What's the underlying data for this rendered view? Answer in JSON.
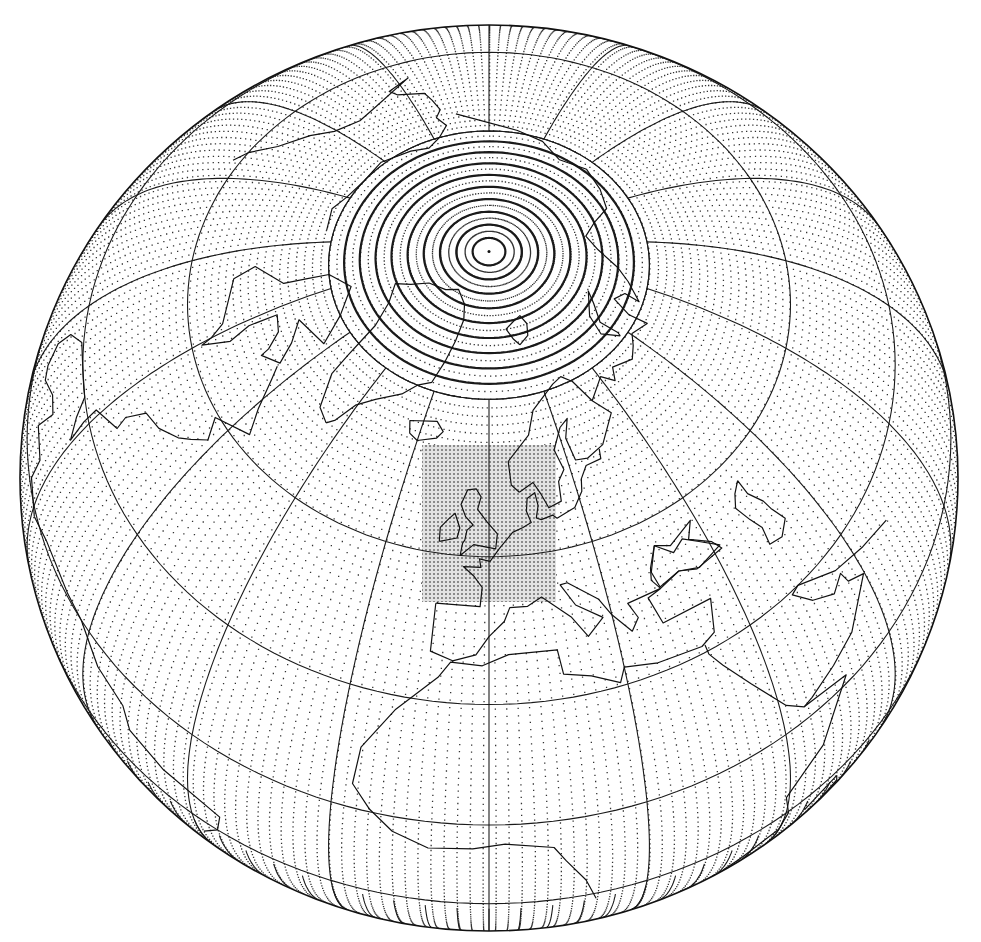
{
  "figure": {
    "caption_fragment": "",
    "projection": {
      "type": "orthographic",
      "center_lat": 60,
      "center_lon": 0,
      "center_x": 489,
      "center_y": 478,
      "radius_x": 469,
      "radius_y": 453
    },
    "graticule": {
      "parallels": [
        -10,
        10,
        30,
        50,
        70
      ],
      "meridian_step": 20,
      "polar_cap_lat": 70,
      "polar_rings": [
        72,
        74,
        76,
        78,
        80,
        82,
        84,
        86,
        88
      ],
      "line_color": "#1a1a1a"
    },
    "grid_points": {
      "lat_step_deg": 1.1,
      "lon_step_deg": 1.6,
      "dot_color": "#333333"
    },
    "high_res_domain": {
      "label": "high-resolution inner domain",
      "x": 422,
      "y": 445,
      "width": 134,
      "height": 157,
      "fill": "#d4d4d4",
      "dot_spacing": 4
    },
    "coastline_color": "#111111"
  }
}
